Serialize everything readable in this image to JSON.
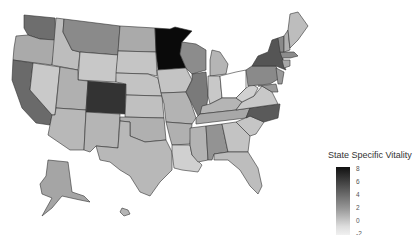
{
  "legend": {
    "title": "State Specific Vitality",
    "ticks": [
      "8",
      "6",
      "4",
      "2",
      "0",
      "-2"
    ],
    "scale": {
      "min": -2,
      "max": 8,
      "low_color": "#f5f5f5",
      "high_color": "#111111"
    }
  },
  "states": [
    {
      "id": "WA",
      "fill": "#6e6e6e",
      "d": "M24,15 L55,18 L56,40 L40,39 L28,35 L24,28 Z"
    },
    {
      "id": "OR",
      "fill": "#aaaaaa",
      "d": "M16,36 L28,35 L40,39 L56,40 L52,65 L13,60 L14,48 Z"
    },
    {
      "id": "CA",
      "fill": "#6a6a6a",
      "d": "M13,60 L33,63 L30,90 L52,115 L50,125 L36,123 L22,108 L12,80 Z"
    },
    {
      "id": "NV",
      "fill": "#c9c9c9",
      "d": "M33,63 L60,67 L55,115 L52,115 L30,90 Z"
    },
    {
      "id": "ID",
      "fill": "#bdbdbd",
      "d": "M56,18 L64,19 L63,32 L72,50 L80,52 L78,70 L52,65 Z"
    },
    {
      "id": "MT",
      "fill": "#8a8a8a",
      "d": "M64,19 L120,26 L118,55 L80,52 L72,50 L63,32 Z"
    },
    {
      "id": "WY",
      "fill": "#c8c8c8",
      "d": "M80,52 L118,55 L116,82 L78,80 Z"
    },
    {
      "id": "UT",
      "fill": "#b0b0b0",
      "d": "M60,67 L78,70 L78,80 L88,81 L86,110 L56,108 Z"
    },
    {
      "id": "AZ",
      "fill": "#b8b8b8",
      "d": "M56,108 L86,110 L84,150 L70,150 L48,135 L52,115 L55,115 Z"
    },
    {
      "id": "CO",
      "fill": "#333333",
      "d": "M88,81 L126,84 L125,114 L86,112 Z"
    },
    {
      "id": "NM",
      "fill": "#b5b5b5",
      "d": "M86,112 L120,114 L118,148 L96,146 L90,152 L84,150 Z"
    },
    {
      "id": "ND",
      "fill": "#aaaaaa",
      "d": "M120,26 L155,28 L156,52 L118,51 Z"
    },
    {
      "id": "SD",
      "fill": "#c5c5c5",
      "d": "M118,51 L156,52 L157,76 L148,74 L116,73 Z"
    },
    {
      "id": "NE",
      "fill": "#c3c3c3",
      "d": "M116,73 L148,74 L158,78 L162,96 L126,95 L126,84 L116,82 Z"
    },
    {
      "id": "KS",
      "fill": "#c0c0c0",
      "d": "M126,95 L162,96 L164,118 L125,117 Z"
    },
    {
      "id": "OK",
      "fill": "#b0b0b0",
      "d": "M120,117 L164,118 L166,140 L145,142 L130,136 L130,122 L120,121 Z"
    },
    {
      "id": "TX",
      "fill": "#b8b8b8",
      "d": "M130,122 L130,136 L145,142 L166,140 L172,152 L172,170 L160,182 L150,196 L140,192 L130,176 L120,170 L110,162 L100,160 L96,146 L118,148 L120,121 Z"
    },
    {
      "id": "MN",
      "fill": "#0a0a0a",
      "d": "M155,28 L170,29 L175,27 L192,31 L182,42 L180,54 L186,68 L158,70 L156,52 Z"
    },
    {
      "id": "IA",
      "fill": "#c4c4c4",
      "d": "M157,70 L186,68 L192,80 L186,92 L161,93 L158,78 Z"
    },
    {
      "id": "MO",
      "fill": "#b3b3b3",
      "d": "M161,93 L186,92 L190,100 L196,118 L192,124 L166,122 L164,104 Z"
    },
    {
      "id": "AR",
      "fill": "#b0b0b0",
      "d": "M166,122 L192,124 L190,144 L172,145 L170,138 Z"
    },
    {
      "id": "LA",
      "fill": "#d0d0d0",
      "d": "M172,145 L190,145 L192,155 L202,165 L198,172 L182,170 L174,168 L172,152 Z"
    },
    {
      "id": "WI",
      "fill": "#8c8c8c",
      "d": "M182,42 L196,44 L206,50 L206,70 L192,74 L186,68 L180,54 Z"
    },
    {
      "id": "IL",
      "fill": "#7a7a7a",
      "d": "M192,74 L206,72 L208,96 L206,112 L198,116 L190,100 L186,92 L192,80 Z"
    },
    {
      "id": "MI",
      "fill": "#b5b5b5",
      "d": "M212,50 L220,52 L228,64 L226,74 L210,76 L210,60 Z"
    },
    {
      "id": "IN",
      "fill": "#c8c8c8",
      "d": "M208,76 L220,76 L222,98 L210,104 L208,96 Z"
    },
    {
      "id": "OH",
      "fill": "#ffffff",
      "d": "M220,76 L236,72 L246,70 L246,88 L236,98 L222,98 Z"
    },
    {
      "id": "KY",
      "fill": "#b5b5b5",
      "d": "M202,106 L210,104 L222,98 L236,98 L242,102 L236,110 L200,114 Z"
    },
    {
      "id": "TN",
      "fill": "#a8a8a8",
      "d": "M196,118 L200,114 L236,110 L250,108 L246,118 L196,124 Z"
    },
    {
      "id": "MS",
      "fill": "#b3b3b3",
      "d": "M190,128 L206,126 L208,160 L198,162 L192,155 L190,145 Z"
    },
    {
      "id": "AL",
      "fill": "#939393",
      "d": "M206,126 L222,124 L228,152 L214,154 L212,160 L208,160 Z"
    },
    {
      "id": "GA",
      "fill": "#c3c3c3",
      "d": "M222,124 L236,122 L250,136 L248,152 L228,152 Z"
    },
    {
      "id": "FL",
      "fill": "#bdbdbd",
      "d": "M214,154 L228,152 L248,152 L258,168 L262,186 L258,194 L250,186 L240,170 L228,160 L214,160 Z"
    },
    {
      "id": "SC",
      "fill": "#c5c5c5",
      "d": "M236,122 L250,116 L264,122 L256,134 L250,136 Z"
    },
    {
      "id": "NC",
      "fill": "#5a5a5a",
      "d": "M246,118 L250,108 L280,104 L278,118 L264,122 L250,116 Z"
    },
    {
      "id": "VA",
      "fill": "#c8c8c8",
      "d": "M236,110 L242,102 L254,96 L262,86 L272,92 L278,104 L250,108 Z"
    },
    {
      "id": "WV",
      "fill": "#d0d0d0",
      "d": "M236,98 L246,88 L252,84 L258,88 L254,96 L242,102 Z"
    },
    {
      "id": "PA",
      "fill": "#8a8a8a",
      "d": "M246,70 L252,66 L276,66 L280,78 L270,84 L248,86 Z"
    },
    {
      "id": "MD",
      "fill": "#9a9a9a",
      "d": "M258,86 L276,84 L278,92 L272,92 L262,86 Z"
    },
    {
      "id": "NJ",
      "fill": "#9a9a9a",
      "d": "M276,68 L284,72 L282,84 L278,84 Z"
    },
    {
      "id": "NY",
      "fill": "#555555",
      "d": "M252,66 L258,56 L268,52 L272,40 L278,38 L282,52 L284,66 L286,70 L276,66 Z"
    },
    {
      "id": "CT",
      "fill": "#a8a8a8",
      "d": "M282,60 L290,60 L290,66 L284,68 Z"
    },
    {
      "id": "MA",
      "fill": "#8c8c8c",
      "d": "M280,52 L294,52 L298,56 L290,58 L282,58 Z"
    },
    {
      "id": "VT",
      "fill": "#8a8a8a",
      "d": "M278,38 L284,36 L284,52 L280,52 Z"
    },
    {
      "id": "NH",
      "fill": "#b0b0b0",
      "d": "M284,36 L288,30 L290,50 L284,52 Z"
    },
    {
      "id": "ME",
      "fill": "#bdbdbd",
      "d": "M288,30 L290,14 L298,12 L308,26 L298,40 L290,48 Z"
    },
    {
      "id": "AK",
      "fill": "#a5a5a5",
      "d": "M48,160 L68,162 L72,192 L84,196 L90,202 L80,200 L62,196 L52,208 L42,216 L52,198 L42,194 L40,184 L46,176 Z"
    },
    {
      "id": "HI",
      "fill": "#b5b5b5",
      "d": "M122,208 L128,210 L130,214 L124,216 L120,212 Z"
    }
  ]
}
